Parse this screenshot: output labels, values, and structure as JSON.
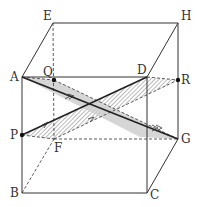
{
  "diagram": {
    "type": "cube-geometry",
    "vertices": {
      "A": {
        "label": "A",
        "x": 22,
        "y": 77
      },
      "B": {
        "label": "B",
        "x": 22,
        "y": 193
      },
      "C": {
        "label": "C",
        "x": 147,
        "y": 193
      },
      "D": {
        "label": "D",
        "x": 147,
        "y": 77
      },
      "E": {
        "label": "E",
        "x": 53,
        "y": 23
      },
      "F": {
        "label": "F",
        "x": 54,
        "y": 139
      },
      "G": {
        "label": "G",
        "x": 178,
        "y": 139
      },
      "H": {
        "label": "H",
        "x": 178,
        "y": 23
      }
    },
    "points": {
      "P": {
        "label": "P",
        "x": 22,
        "y": 135
      },
      "Q": {
        "label": "Q",
        "x": 54,
        "y": 80
      },
      "R": {
        "label": "R",
        "x": 178,
        "y": 80
      }
    },
    "colors": {
      "line": "#333333",
      "shaded_plane": "#cfcfcf",
      "hatch": "#555555"
    }
  }
}
